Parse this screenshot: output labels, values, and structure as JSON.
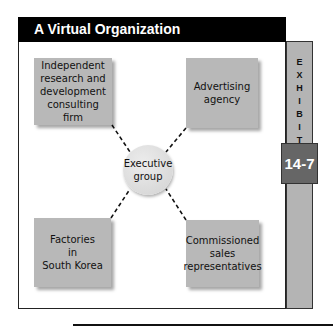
{
  "title": "A Virtual Organization",
  "exhibit": {
    "label_letters": [
      "E",
      "X",
      "H",
      "I",
      "B",
      "I",
      "T"
    ],
    "number": "14-7"
  },
  "center": {
    "label": "Executive\ngroup"
  },
  "nodes": [
    {
      "position": "top-left",
      "label": "Independent\nresearch and\ndevelopment\nconsulting\nfirm"
    },
    {
      "position": "top-right",
      "label": "Advertising\nagency"
    },
    {
      "position": "bottom-left",
      "label": "Factories\nin\nSouth Korea"
    },
    {
      "position": "bottom-right",
      "label": "Commissioned\nsales\nrepresentatives"
    }
  ],
  "colors": {
    "header_bg": "#000000",
    "node_fill": "#b8b8b8",
    "strip_fill": "#b4b4b4",
    "badge_fill": "#666666"
  }
}
